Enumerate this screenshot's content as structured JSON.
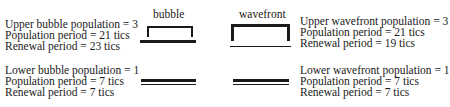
{
  "labels": {
    "bubble": "bubble",
    "wavefront": "wavefront"
  },
  "upper_bubble": {
    "lines": [
      "Upper bubble population = 3",
      "Population period = 21 tics",
      "Renewal period = 23 tics"
    ]
  },
  "lower_bubble": {
    "lines": [
      "Lower bubble population = 1",
      "Population period = 7 tics",
      "Renewal period = 7 tics"
    ]
  },
  "upper_wavefront": {
    "lines": [
      "Upper wavefront population = 3",
      "Population period = 21 tics",
      "Renewal period = 19 tics"
    ]
  },
  "lower_wavefront": {
    "lines": [
      "Lower wavefront population = 1",
      "Population period = 7 tics",
      "Renewal period = 7 tics"
    ]
  },
  "colors": {
    "ink": "#1a1a1a",
    "background": "#ffffff"
  }
}
